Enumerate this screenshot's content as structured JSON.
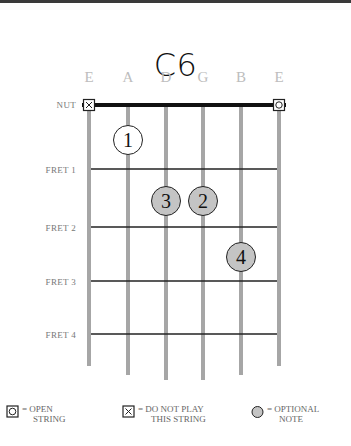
{
  "chord": {
    "name": "C6"
  },
  "strings": [
    {
      "name": "E",
      "marker": "mute"
    },
    {
      "name": "A",
      "marker": null
    },
    {
      "name": "D",
      "marker": null
    },
    {
      "name": "G",
      "marker": null
    },
    {
      "name": "B",
      "marker": null
    },
    {
      "name": "E",
      "marker": "open"
    }
  ],
  "nut_label": "NUT",
  "fret_labels": [
    "FRET 1",
    "FRET 2",
    "FRET 3",
    "FRET 4"
  ],
  "fingers": [
    {
      "label": "1",
      "string": 5,
      "fret": 1,
      "optional": false
    },
    {
      "label": "2",
      "string": 3,
      "fret": 2,
      "optional": true
    },
    {
      "label": "3",
      "string": 4,
      "fret": 2,
      "optional": true
    },
    {
      "label": "4",
      "string": 2,
      "fret": 3,
      "optional": true
    }
  ],
  "legend": [
    {
      "icon": "open-string-icon",
      "line1": "= OPEN",
      "line2": "STRING"
    },
    {
      "icon": "mute-string-icon",
      "line1": "= DO NOT PLAY",
      "line2": "THIS STRING"
    },
    {
      "icon": "optional-note-icon",
      "line1": "= OPTIONAL",
      "line2": "NOTE"
    }
  ],
  "colors": {
    "string": "#a6a6a6",
    "fret": "#222222",
    "nut": "#111111",
    "optional_fill": "#c4c4c4",
    "finger_fill": "#ffffff",
    "string_name": "#bdbdbd"
  }
}
